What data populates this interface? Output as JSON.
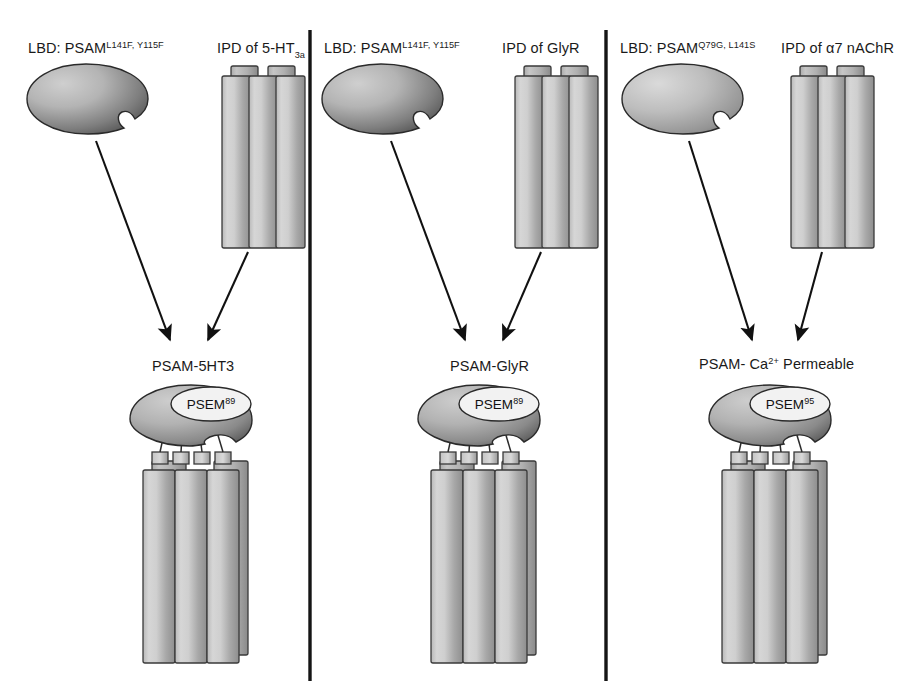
{
  "figure": {
    "background_color": "#ffffff",
    "divider_color": "#151515",
    "arrow_color": "#111111",
    "protein_fill_light": "#d8d8d8",
    "protein_fill_dark": "#4a4a4a",
    "badge_fill": "#f2f2f2"
  },
  "panels": [
    {
      "id": "panel-psam-5ht3",
      "lbd_label_prefix": "LBD: PSAM",
      "lbd_label_superscript": "L141F, Y115F",
      "ipd_label": "IPD of 5-HT",
      "ipd_label_subscript": "3a",
      "product_label": "PSAM-5HT3",
      "ligand_badge_prefix": "PSEM",
      "ligand_badge_superscript": "89",
      "cylinder_count": 4,
      "linker_count": 4
    },
    {
      "id": "panel-psam-glyr",
      "lbd_label_prefix": "LBD: PSAM",
      "lbd_label_superscript": "L141F, Y115F",
      "ipd_label": "IPD of GlyR",
      "ipd_label_subscript": "",
      "product_label": "PSAM-GlyR",
      "ligand_badge_prefix": "PSEM",
      "ligand_badge_superscript": "89",
      "cylinder_count": 4,
      "linker_count": 4
    },
    {
      "id": "panel-psam-ca-permeable",
      "lbd_label_prefix": "LBD: PSAM",
      "lbd_label_superscript": "Q79G, L141S",
      "ipd_label": "IPD of α7 nAChR",
      "ipd_label_subscript": "",
      "product_label_prefix": "PSAM- Ca",
      "product_label_superscript": "2+",
      "product_label_suffix": " Permeable",
      "ligand_badge_prefix": "PSEM",
      "ligand_badge_superscript": "95",
      "cylinder_count": 4,
      "linker_count": 4
    }
  ]
}
